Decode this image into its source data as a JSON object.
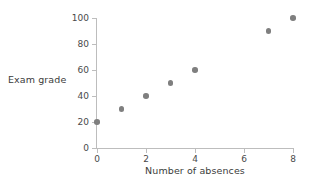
{
  "chart_data": {
    "type": "scatter",
    "title": "",
    "xlabel": "Number of absences",
    "ylabel": "Exam grade",
    "xlim": [
      0,
      8
    ],
    "ylim": [
      0,
      100
    ],
    "xticks": [
      "0",
      "2",
      "4",
      "6",
      "8"
    ],
    "xtick_values": [
      0,
      2,
      4,
      6,
      8
    ],
    "yticks": [
      "0",
      "20",
      "40",
      "60",
      "80",
      "100"
    ],
    "ytick_values": [
      0,
      20,
      40,
      60,
      80,
      100
    ],
    "grid": false,
    "legend": null,
    "marker_color": "#7f7f7f",
    "axis_color": "#bdbdbd",
    "points": [
      {
        "x": 0,
        "y": 20
      },
      {
        "x": 1,
        "y": 30
      },
      {
        "x": 2,
        "y": 40
      },
      {
        "x": 3,
        "y": 50
      },
      {
        "x": 4,
        "y": 60
      },
      {
        "x": 7,
        "y": 90
      },
      {
        "x": 8,
        "y": 100
      }
    ]
  }
}
